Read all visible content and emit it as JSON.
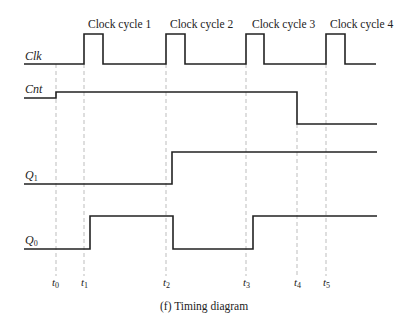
{
  "title": "Timing diagram",
  "caption": "(f)  Timing diagram",
  "clock_cycles": [
    "Clock cycle 1",
    "Clock cycle 2",
    "Clock cycle 3",
    "Clock cycle 4"
  ],
  "signals": [
    {
      "name": "Clk",
      "label": "Clk",
      "sub": ""
    },
    {
      "name": "Cnt",
      "label": "Cnt",
      "sub": ""
    },
    {
      "name": "Q1",
      "label": "Q",
      "sub": "1"
    },
    {
      "name": "Q0",
      "label": "Q",
      "sub": "0"
    }
  ],
  "time_markers": [
    {
      "label": "t",
      "sub": "0"
    },
    {
      "label": "t",
      "sub": "1"
    },
    {
      "label": "t",
      "sub": "2"
    },
    {
      "label": "t",
      "sub": "3"
    },
    {
      "label": "t",
      "sub": "4"
    },
    {
      "label": "t",
      "sub": "5"
    }
  ],
  "colors": {
    "line": "#222222",
    "dash": "#bbbbbb"
  }
}
